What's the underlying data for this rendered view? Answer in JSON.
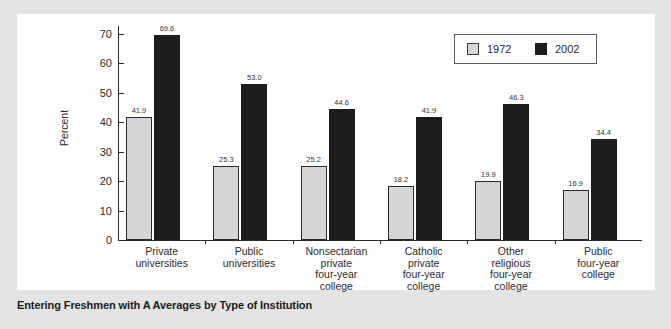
{
  "caption": "Entering Freshmen with A Averages by Type of Institution",
  "legend": {
    "items": [
      {
        "label": "1972",
        "color": "#d6d6d6"
      },
      {
        "label": "2002",
        "color": "#1c1c1c"
      }
    ]
  },
  "axis": {
    "y_title": "Percent",
    "y_ticks": [
      "0",
      "10",
      "20",
      "30",
      "40",
      "50",
      "60",
      "70"
    ]
  },
  "chart_data": {
    "type": "bar",
    "title": "Entering Freshmen with A Averages by Type of Institution",
    "xlabel": "",
    "ylabel": "Percent",
    "ylim": [
      0,
      70
    ],
    "ytick_step": 10,
    "grid": false,
    "legend_position": "top-right",
    "categories": [
      "Private universities",
      "Public universities",
      "Nonsectarian private four-year college",
      "Catholic private four-year college",
      "Other religious four-year college",
      "Public four-year college"
    ],
    "category_lines": [
      [
        "Private",
        "universities"
      ],
      [
        "Public",
        "universities"
      ],
      [
        "Nonsectarian",
        "private",
        "four-year",
        "college"
      ],
      [
        "Catholic",
        "private",
        "four-year",
        "college"
      ],
      [
        "Other",
        "religious",
        "four-year",
        "college"
      ],
      [
        "Public",
        "four-year",
        "college"
      ]
    ],
    "series": [
      {
        "name": "1972",
        "color": "#d6d6d6",
        "values": [
          41.9,
          25.3,
          25.2,
          18.2,
          19.9,
          16.9
        ]
      },
      {
        "name": "2002",
        "color": "#1c1c1c",
        "values": [
          69.6,
          53.0,
          44.6,
          41.9,
          46.3,
          34.4
        ]
      }
    ],
    "data_labels": {
      "1972": [
        "41.9",
        "25.3",
        "25.2",
        "18.2",
        "19.9",
        "16.9"
      ],
      "2002": [
        "69.6",
        "53.0",
        "44.6",
        "41.9",
        "46.3",
        "34.4"
      ]
    }
  }
}
